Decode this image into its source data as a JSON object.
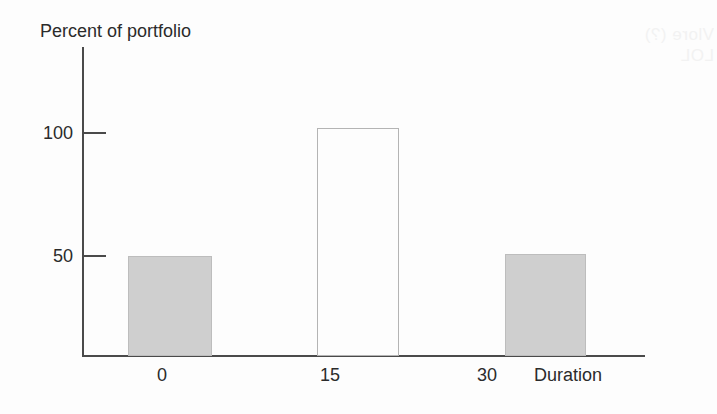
{
  "chart_data": {
    "type": "bar",
    "title": "",
    "ylabel": "Percent of portfolio",
    "xlabel": "Duration",
    "categories": [
      "0",
      "15",
      "30"
    ],
    "values": [
      50,
      102,
      51
    ],
    "ylim": [
      0,
      126
    ],
    "xlim": [
      -7.5,
      37.5
    ],
    "yticks": [
      50,
      100
    ],
    "ytick_labels": [
      "50",
      "100"
    ],
    "xticks": [
      0,
      15,
      30
    ],
    "xtick_labels": [
      "0",
      "15",
      "30"
    ],
    "grid": false,
    "legend": null,
    "bars": [
      {
        "category": "0",
        "value": 50,
        "style": "filled",
        "fill": "#cfcfcf",
        "stroke": "#bdbdbd"
      },
      {
        "category": "15",
        "value": 102,
        "style": "hollow",
        "fill": "#fdfdfd",
        "stroke": "#b4b4b4"
      },
      {
        "category": "30",
        "value": 51,
        "style": "filled",
        "fill": "#cfcfcf",
        "stroke": "#bdbdbd"
      }
    ]
  },
  "artifact": {
    "bleed_text": "Vlore (?)\nLOL"
  }
}
